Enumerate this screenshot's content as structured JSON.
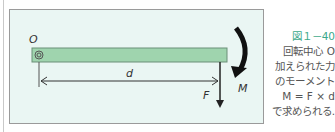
{
  "diagram": {
    "labels": {
      "origin": "O",
      "distance": "d",
      "force": "F",
      "moment": "M"
    },
    "colors": {
      "background": "#eaf6f3",
      "beam": "#9fd4ae",
      "caption_title": "#3aa88a"
    }
  },
  "caption": {
    "title": "図１－40",
    "lines": [
      "回転中心 O",
      "加えられた力",
      "のモーメント",
      "M = F × d",
      "で求められる."
    ]
  }
}
